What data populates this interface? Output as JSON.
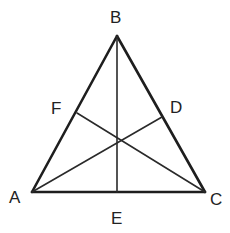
{
  "diagram": {
    "type": "triangle-with-cevians",
    "stroke_color": "#1e1e1e",
    "background": "#ffffff",
    "points": {
      "A": {
        "x": 32,
        "y": 192
      },
      "B": {
        "x": 117,
        "y": 36
      },
      "C": {
        "x": 205,
        "y": 192
      },
      "D": {
        "x": 162,
        "y": 117
      },
      "E": {
        "x": 117,
        "y": 192
      },
      "F": {
        "x": 77,
        "y": 113
      },
      "O": {
        "x": 118,
        "y": 140
      }
    },
    "triangle": [
      "A",
      "B",
      "C"
    ],
    "segments": [
      {
        "from": "B",
        "to": "E"
      },
      {
        "from": "A",
        "to": "D"
      },
      {
        "from": "C",
        "to": "F"
      }
    ],
    "labels": {
      "A": "A",
      "B": "B",
      "C": "C",
      "D": "D",
      "E": "E",
      "F": "F"
    }
  }
}
